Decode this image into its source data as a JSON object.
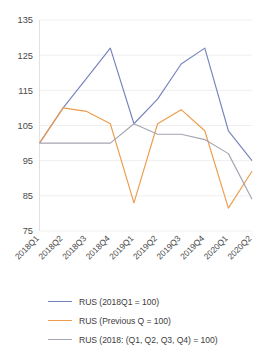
{
  "chart_data": {
    "type": "line",
    "title": "",
    "subtitle": "",
    "xlabel": "",
    "ylabel": "",
    "categories": [
      "2018Q1",
      "2018Q2",
      "2018Q3",
      "2018Q4",
      "2019Q1",
      "2019Q2",
      "2019Q3",
      "2019Q4",
      "2020Q1",
      "2020Q2"
    ],
    "ylim": [
      75,
      135
    ],
    "yticks": [
      75,
      85,
      95,
      105,
      115,
      125,
      135
    ],
    "ytick_labels": [
      "75",
      "85",
      "95",
      "105",
      "115",
      "125",
      "135"
    ],
    "grid": true,
    "legend_position": "bottom",
    "series": [
      {
        "name": "RUS (2018Q1 = 100)",
        "color": "#7684bd",
        "values": [
          100,
          110,
          118.5,
          127,
          105.5,
          112.5,
          122.5,
          127,
          103.5,
          95
        ]
      },
      {
        "name": "RUS (Previous Q = 100)",
        "color": "#ed9c4c",
        "values": [
          100,
          110,
          109,
          105.5,
          83,
          105.5,
          109.5,
          103.5,
          81.5,
          92
        ]
      },
      {
        "name": "RUS (2018: (Q1, Q2, Q3, Q4) = 100)",
        "color": "#a5a5b4",
        "values": [
          100,
          100,
          100,
          100,
          105.5,
          102.5,
          102.5,
          101,
          97,
          84
        ]
      }
    ]
  },
  "legend": {
    "items": [
      {
        "label": "RUS (2018Q1 = 100)",
        "color": "#7684bd"
      },
      {
        "label": "RUS (Previous Q = 100)",
        "color": "#ed9c4c"
      },
      {
        "label": "RUS (2018: (Q1, Q2, Q3, Q4) = 100)",
        "color": "#a5a5b4"
      }
    ]
  },
  "colors": {
    "series_1": "#7684bd",
    "series_2": "#ed9c4c",
    "series_3": "#a5a5b4",
    "gridline": "#e8e8e8",
    "axis_text": "#4a4a4a",
    "background": "#ffffff"
  }
}
